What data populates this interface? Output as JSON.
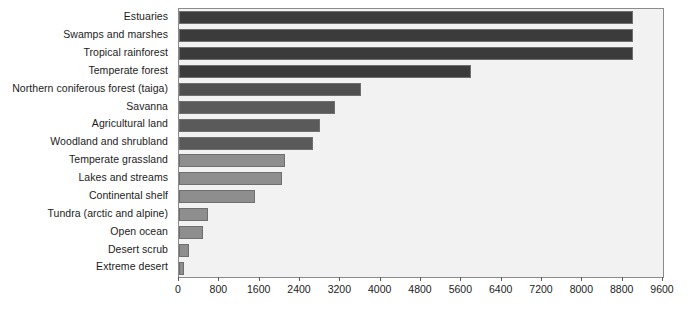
{
  "chart": {
    "title": "",
    "xlabel": "",
    "ylabel": ""
  },
  "chart_data": {
    "type": "bar",
    "orientation": "horizontal",
    "title": "",
    "xlabel": "",
    "ylabel": "",
    "xlim": [
      0,
      9600
    ],
    "xticks": [
      0,
      800,
      1600,
      2400,
      3200,
      4000,
      4800,
      5600,
      6400,
      7200,
      8000,
      8800,
      9600
    ],
    "xtick_labels": [
      "0",
      "800",
      "1600",
      "2400",
      "3200",
      "4000",
      "4800",
      "5600",
      "6400",
      "7200",
      "8000",
      "8800",
      "9600"
    ],
    "grid": false,
    "legend": null,
    "categories": [
      "Estuaries",
      "Swamps and marshes",
      "Tropical rainforest",
      "Temperate forest",
      "Northern coniferous forest (taiga)",
      "Savanna",
      "Agricultural land",
      "Woodland and shrubland",
      "Temperate grassland",
      "Lakes and streams",
      "Continental shelf",
      "Tundra (arctic and alpine)",
      "Open ocean",
      "Desert scrub",
      "Extreme desert"
    ],
    "values": [
      9000,
      9000,
      9000,
      5800,
      3600,
      3100,
      2800,
      2650,
      2100,
      2050,
      1500,
      580,
      480,
      200,
      90
    ],
    "bar_colors": [
      "#3b3b3b",
      "#3b3b3b",
      "#3b3b3b",
      "#3b3b3b",
      "#4f4f4f",
      "#5a5a5a",
      "#5a5a5a",
      "#5a5a5a",
      "#8e8e8e",
      "#8e8e8e",
      "#8e8e8e",
      "#8e8e8e",
      "#8e8e8e",
      "#8e8e8e",
      "#8e8e8e"
    ],
    "plot_background": "#f2f2f2",
    "frame_color": "#8b8b8b",
    "text_color": "#1b1b1b"
  }
}
